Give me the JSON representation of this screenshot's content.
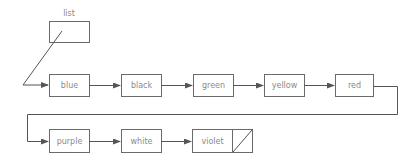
{
  "diagram": {
    "type": "linked-list",
    "variable": {
      "label": "list"
    },
    "nodes": [
      {
        "label": "blue"
      },
      {
        "label": "black"
      },
      {
        "label": "green"
      },
      {
        "label": "yellow"
      },
      {
        "label": "red"
      },
      {
        "label": "purple"
      },
      {
        "label": "white"
      },
      {
        "label": "violet",
        "next": "null"
      }
    ],
    "colors": {
      "stroke": "#6a6a6a",
      "edge": "#555555",
      "text": "#8a8a8a",
      "background": "#ffffff"
    }
  }
}
